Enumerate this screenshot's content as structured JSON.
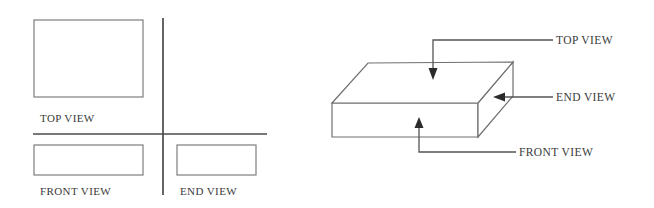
{
  "figure": {
    "background_color": "#ffffff",
    "line_color": "#6f6f6f",
    "axis_color": "#4a4a4a",
    "text_color": "#3a3a3a"
  },
  "orthographic_panel": {
    "name": "first-angle-projection-layout",
    "views": [
      {
        "id": "top",
        "label": "TOP VIEW",
        "rect": {
          "x": 34,
          "y": 20,
          "width": 109,
          "height": 77
        },
        "label_pos": {
          "x": 40,
          "y": 122
        }
      },
      {
        "id": "front",
        "label": "FRONT VIEW",
        "rect": {
          "x": 34,
          "y": 145,
          "width": 109,
          "height": 30
        },
        "label_pos": {
          "x": 40,
          "y": 195
        }
      },
      {
        "id": "end",
        "label": "END VIEW",
        "rect": {
          "x": 177,
          "y": 145,
          "width": 79,
          "height": 30
        },
        "label_pos": {
          "x": 180,
          "y": 195
        }
      }
    ],
    "axes": {
      "vertical": {
        "x": 163,
        "y1": 18,
        "y2": 195
      },
      "horizontal": {
        "y": 134,
        "x1": 33,
        "x2": 267
      }
    }
  },
  "pictorial_panel": {
    "name": "isometric-block-with-callouts",
    "block": {
      "top_face": "368,63 513,62 478,103 332,103",
      "front_face": "332,103 478,103 478,137 332,137",
      "side_face": "478,103 513,62 513,96 478,137"
    },
    "callouts": [
      {
        "id": "top",
        "label": "TOP VIEW",
        "path": "M 553,40 L 433,40 L 433,68",
        "arrow": "433,80 428.5,68 437.5,68",
        "label_pos": {
          "x": 556,
          "y": 44
        }
      },
      {
        "id": "end",
        "label": "END VIEW",
        "path": "M 553,97 L 505,97",
        "arrow": "493,97 505,92.5 505,101.5",
        "label_pos": {
          "x": 556,
          "y": 101
        }
      },
      {
        "id": "front",
        "label": "FRONT VIEW",
        "path": "M 516,152 L 419,152 L 419,128",
        "arrow": "419,117 414.5,128 423.5,128",
        "label_pos": {
          "x": 519,
          "y": 156
        }
      }
    ]
  }
}
